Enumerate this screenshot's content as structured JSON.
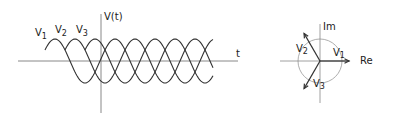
{
  "waveform": {
    "y_axis_label": "V(t)",
    "x_axis_label": "t",
    "series": [
      {
        "name": "V1",
        "label_main": "V",
        "label_sub": "1",
        "phase_deg": 0
      },
      {
        "name": "V2",
        "label_main": "V",
        "label_sub": "2",
        "phase_deg": 120
      },
      {
        "name": "V3",
        "label_main": "V",
        "label_sub": "3",
        "phase_deg": 240
      }
    ]
  },
  "phasor": {
    "imag_label": "Im",
    "real_label": "Re",
    "phasors": [
      {
        "name": "V1",
        "label_main": "V",
        "label_sub": "1",
        "angle_deg": 0
      },
      {
        "name": "V2",
        "label_main": "V",
        "label_sub": "2",
        "angle_deg": 120
      },
      {
        "name": "V3",
        "label_main": "V",
        "label_sub": "3",
        "angle_deg": 240
      }
    ]
  },
  "colors": {
    "ink": "#333333",
    "axis": "#888888",
    "circle": "#999999"
  }
}
